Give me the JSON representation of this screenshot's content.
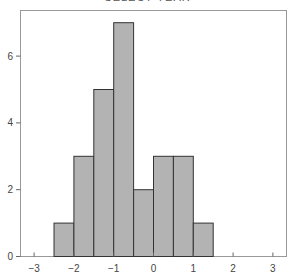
{
  "chart_data": {
    "type": "bar",
    "subtype": "histogram",
    "title": "SELECT YEAR",
    "title_cropped": true,
    "xlabel": "",
    "ylabel": "",
    "bin_edges": [
      -2.5,
      -2.0,
      -1.5,
      -1.0,
      -0.5,
      0.0,
      0.5,
      1.0,
      1.5
    ],
    "categories": [
      "[-2.5,-2.0)",
      "[-2.0,-1.5)",
      "[-1.5,-1.0)",
      "[-1.0,-0.5)",
      "[-0.5,0.0)",
      "[0.0,0.5)",
      "[0.5,1.0)",
      "[1.0,1.5)"
    ],
    "values": [
      1,
      3,
      5,
      7,
      2,
      3,
      3,
      1
    ],
    "xlim": [
      -3.35,
      3.35
    ],
    "ylim": [
      0,
      7.3
    ],
    "xticks": [
      -3,
      -2,
      -1,
      0,
      1,
      2,
      3
    ],
    "xtick_labels": [
      "−3",
      "−2",
      "−1",
      "0",
      "1",
      "2",
      "3"
    ],
    "yticks": [
      0,
      2,
      4,
      6
    ],
    "ytick_labels": [
      "0",
      "2",
      "4",
      "6"
    ],
    "grid": false,
    "legend": null,
    "colors": {
      "bar_fill": "#b3b3b3",
      "bar_edge": "#333333",
      "axis": "#888888"
    }
  }
}
